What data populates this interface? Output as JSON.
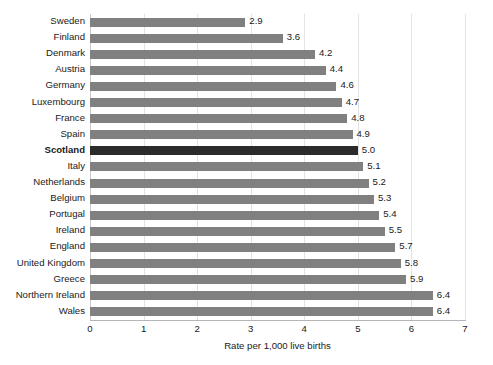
{
  "chart_data": {
    "type": "bar",
    "orientation": "horizontal",
    "title": "",
    "subtitle": "",
    "xlabel": "Rate per 1,000 live births",
    "ylabel": "",
    "xlim": [
      0,
      7
    ],
    "xticks": [
      0,
      1,
      2,
      3,
      4,
      5,
      6,
      7
    ],
    "xtick_labels": [
      "0",
      "1",
      "2",
      "3",
      "4",
      "5",
      "6",
      "7"
    ],
    "grid": true,
    "grid_axis": "x",
    "legend": false,
    "legend_position": "none",
    "data_labels": true,
    "categories": [
      "Sweden",
      "Finland",
      "Denmark",
      "Austria",
      "Germany",
      "Luxembourg",
      "France",
      "Spain",
      "Scotland",
      "Italy",
      "Netherlands",
      "Belgium",
      "Portugal",
      "Ireland",
      "England",
      "United Kingdom",
      "Greece",
      "Northern Ireland",
      "Wales"
    ],
    "values": [
      2.9,
      3.6,
      4.2,
      4.4,
      4.6,
      4.7,
      4.8,
      4.9,
      5.0,
      5.1,
      5.2,
      5.3,
      5.4,
      5.5,
      5.7,
      5.8,
      5.9,
      6.4,
      6.4
    ],
    "value_labels": [
      "2.9",
      "3.6",
      "4.2",
      "4.4",
      "4.6",
      "4.7",
      "4.8",
      "4.9",
      "5.0",
      "5.1",
      "5.2",
      "5.3",
      "5.4",
      "5.5",
      "5.7",
      "5.8",
      "5.9",
      "6.4",
      "6.4"
    ],
    "highlight_category": "Scotland",
    "highlight_index": 8,
    "colors": {
      "bar": "#808080",
      "bar_highlight": "#2b2b2b",
      "gridline": "#e3e3e3",
      "axis_line": "#b5b5b5",
      "text": "#1a1a1a",
      "background": "#ffffff"
    }
  }
}
